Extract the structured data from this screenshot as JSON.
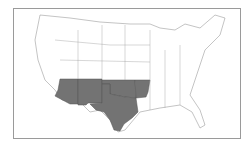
{
  "map": {
    "title": "",
    "region": "Contiguous United States",
    "highlighted_states": [
      "Arizona",
      "New Mexico",
      "Texas",
      "Oklahoma",
      "Arkansas"
    ],
    "colors": {
      "highlight": "#737373",
      "background": "#ffffff",
      "border": "#888888"
    }
  }
}
